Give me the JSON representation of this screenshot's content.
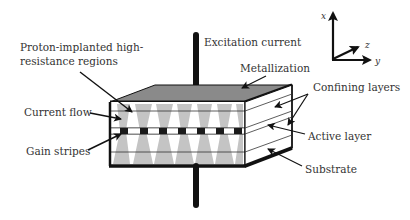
{
  "diagram": {
    "labels": {
      "proton_line1": "Proton-implanted high-",
      "proton_line2": "resistance regions",
      "excitation": "Excitation current",
      "metallization": "Metallization",
      "confining": "Confining layers",
      "current_flow": "Current flow",
      "active": "Active layer",
      "gain_stripes": "Gain stripes",
      "substrate": "Substrate"
    },
    "axes": {
      "x": "x",
      "y": "y",
      "z": "z"
    },
    "colors": {
      "outline": "#111111",
      "top_face": "#8a8a8a",
      "current_region": "#c4c4c4",
      "gain_stripe": "#1a1a1a",
      "text": "#333333"
    },
    "stripe_count": 7
  }
}
